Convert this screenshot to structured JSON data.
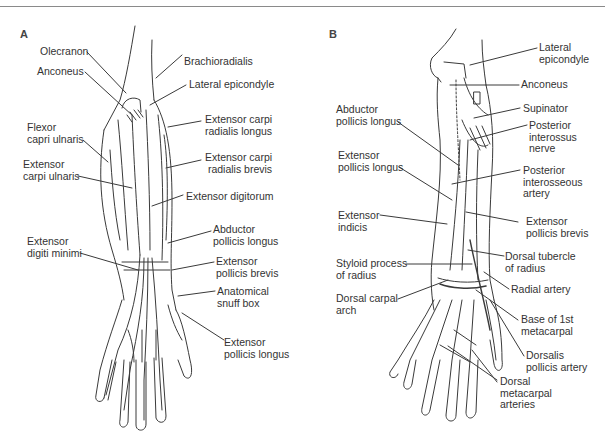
{
  "figure": {
    "panels": [
      {
        "id": "A",
        "letter": "A",
        "labels": {
          "olecranon": "Olecranon",
          "anconeus": "Anconeus",
          "flexor_carpi_ulnaris_1": "Flexor",
          "flexor_carpi_ulnaris_2": "capri ulnaris",
          "extensor_carpi_ulnaris_1": "Extensor",
          "extensor_carpi_ulnaris_2": "carpi ulnaris",
          "extensor_digiti_minimi_1": "Extensor",
          "extensor_digiti_minimi_2": "digiti minimi",
          "brachioradialis": "Brachioradialis",
          "lateral_epicondyle": "Lateral epicondyle",
          "ecrl_1": "Extensor carpi",
          "ecrl_2": "radialis longus",
          "ecrb_1": "Extensor carpi",
          "ecrb_2": "radialis brevis",
          "extensor_digitorum": "Extensor digitorum",
          "apl_1": "Abductor",
          "apl_2": "pollicis longus",
          "epb_1": "Extensor",
          "epb_2": "pollicis brevis",
          "snuff_1": "Anatomical",
          "snuff_2": "snuff box",
          "epl_1": "Extensor",
          "epl_2": "pollicis longus"
        }
      },
      {
        "id": "B",
        "letter": "B",
        "labels": {
          "lateral_epicondyle_1": "Lateral",
          "lateral_epicondyle_2": "epicondyle",
          "anconeus": "Anconeus",
          "supinator": "Supinator",
          "pin_1": "Posterior",
          "pin_2": "interossus",
          "pin_3": "nerve",
          "pia_1": "Posterior",
          "pia_2": "interosseous",
          "pia_3": "artery",
          "epb_1": "Extensor",
          "epb_2": "pollicis brevis",
          "dorsal_tubercle_1": "Dorsal tubercle",
          "dorsal_tubercle_2": "of radius",
          "radial_artery": "Radial artery",
          "base_1st_mc_1": "Base of 1st",
          "base_1st_mc_2": "metacarpal",
          "dorsalis_pollicis_1": "Dorsalis",
          "dorsalis_pollicis_2": "pollicis artery",
          "dorsal_mc_arteries_1": "Dorsal",
          "dorsal_mc_arteries_2": "metacarpal",
          "dorsal_mc_arteries_3": "arteries",
          "apl_1": "Abductor",
          "apl_2": "pollicis longus",
          "epl_1": "Extensor",
          "epl_2": "pollicis longus",
          "ext_indicis_1": "Extensor",
          "ext_indicis_2": "indicis",
          "styloid_1": "Styloid process",
          "styloid_2": "of radius",
          "dorsal_carpal_arch_1": "Dorsal carpal",
          "dorsal_carpal_arch_2": "arch"
        }
      }
    ],
    "colors": {
      "line": "#3a3a3a",
      "text": "#333333",
      "rule": "#8a8a8a"
    }
  }
}
